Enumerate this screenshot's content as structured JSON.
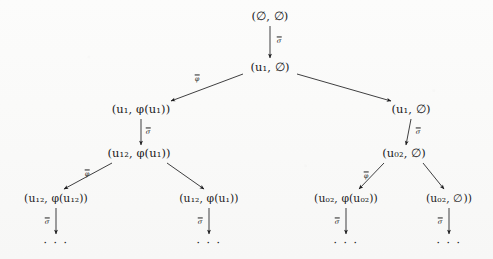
{
  "figure": {
    "background_color": "#fbfbfa",
    "ink_color": "#19191b",
    "nodes": [
      {
        "id": "n0",
        "label": "(∅, ∅)",
        "x": 270,
        "y": 17
      },
      {
        "id": "n1",
        "label": "(u₁, ∅)",
        "x": 270,
        "y": 68
      },
      {
        "id": "n2",
        "label": "(u₁, φ(u₁))",
        "x": 141,
        "y": 110
      },
      {
        "id": "n3",
        "label": "(u₁, ∅)",
        "x": 411,
        "y": 110
      },
      {
        "id": "n4",
        "label": "(u₁₂, φ(u₁))",
        "x": 139,
        "y": 154
      },
      {
        "id": "n5",
        "label": "(u₀₂, ∅)",
        "x": 404,
        "y": 154
      },
      {
        "id": "n6",
        "label": "(u₁₂, φ(u₁₂))",
        "x": 56,
        "y": 199
      },
      {
        "id": "n7",
        "label": "(u₁₂, φ(u₁))",
        "x": 209,
        "y": 199
      },
      {
        "id": "n8",
        "label": "(u₀₂, φ(u₀₂))",
        "x": 346,
        "y": 199
      },
      {
        "id": "n9",
        "label": "(u₀₂, ∅))",
        "x": 449,
        "y": 199
      }
    ],
    "edges": [
      {
        "id": "e0",
        "from": "n0",
        "to": "n1",
        "label": "σ",
        "label_overline": true,
        "label_x": 279,
        "label_y": 41
      },
      {
        "id": "e1",
        "from": "n1",
        "to": "n2",
        "label": "φ",
        "label_overline": true,
        "label_x": 197,
        "label_y": 79
      },
      {
        "id": "e2",
        "from": "n1",
        "to": "n3",
        "label": "",
        "label_overline": false,
        "label_x": 350,
        "label_y": 88
      },
      {
        "id": "e3",
        "from": "n2",
        "to": "n4",
        "label": "σ",
        "label_overline": true,
        "label_x": 148,
        "label_y": 132
      },
      {
        "id": "e4",
        "from": "n3",
        "to": "n5",
        "label": "σ",
        "label_overline": true,
        "label_x": 418,
        "label_y": 132
      },
      {
        "id": "e5",
        "from": "n4",
        "to": "n6",
        "label": "φ",
        "label_overline": true,
        "label_x": 87,
        "label_y": 174
      },
      {
        "id": "e6",
        "from": "n4",
        "to": "n7",
        "label": "",
        "label_overline": false,
        "label_x": 185,
        "label_y": 178
      },
      {
        "id": "e7",
        "from": "n5",
        "to": "n8",
        "label": "φ",
        "label_overline": true,
        "label_x": 366,
        "label_y": 176
      },
      {
        "id": "e8",
        "from": "n5",
        "to": "n9",
        "label": "",
        "label_overline": false,
        "label_x": 434,
        "label_y": 176
      },
      {
        "id": "e9",
        "from": "n6",
        "to": "d0",
        "label": "σ",
        "label_overline": true,
        "label_x": 47,
        "label_y": 222
      },
      {
        "id": "e10",
        "from": "n7",
        "to": "d1",
        "label": "σ",
        "label_overline": true,
        "label_x": 200,
        "label_y": 222
      },
      {
        "id": "e11",
        "from": "n8",
        "to": "d2",
        "label": "σ",
        "label_overline": true,
        "label_x": 337,
        "label_y": 222
      },
      {
        "id": "e12",
        "from": "n9",
        "to": "d3",
        "label": "σ",
        "label_overline": true,
        "label_x": 440,
        "label_y": 222
      }
    ],
    "ellipses": [
      {
        "id": "d0",
        "label": "· · ·",
        "x": 56,
        "y": 243
      },
      {
        "id": "d1",
        "label": "· · ·",
        "x": 209,
        "y": 243
      },
      {
        "id": "d2",
        "label": "· · ·",
        "x": 346,
        "y": 243
      },
      {
        "id": "d3",
        "label": "· · ·",
        "x": 449,
        "y": 243
      }
    ]
  }
}
